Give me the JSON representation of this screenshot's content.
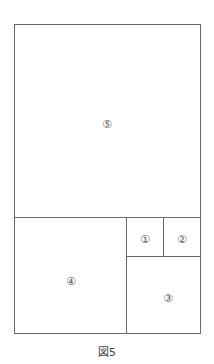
{
  "figure": {
    "caption": "図5",
    "line_color": "#6a6a6a",
    "regions": [
      {
        "id": 1,
        "label": "①"
      },
      {
        "id": 2,
        "label": "②"
      },
      {
        "id": 3,
        "label": "③"
      },
      {
        "id": 4,
        "label": "④"
      },
      {
        "id": 5,
        "label": "⑤"
      }
    ]
  }
}
